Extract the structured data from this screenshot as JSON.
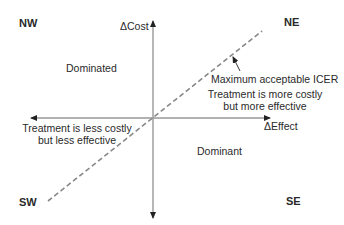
{
  "diagram": {
    "axes": {
      "y_label": "ΔCost",
      "x_label": "ΔEffect"
    },
    "quadrants": {
      "nw": "NW",
      "ne": "NE",
      "sw": "SW",
      "se": "SE"
    },
    "regions": {
      "nw_text": "Dominated",
      "se_text": "Dominant",
      "ne_text_line1": "Treatment is more costly",
      "ne_text_line2": "but more effective",
      "sw_text_line1": "Treatment is less costly",
      "sw_text_line2": "but less effective"
    },
    "threshold_line": {
      "label": "Maximum acceptable ICER",
      "style": "dashed"
    },
    "colors": {
      "axis": "#999999",
      "dashed_line": "#888888",
      "text": "#2a2a2a"
    }
  }
}
